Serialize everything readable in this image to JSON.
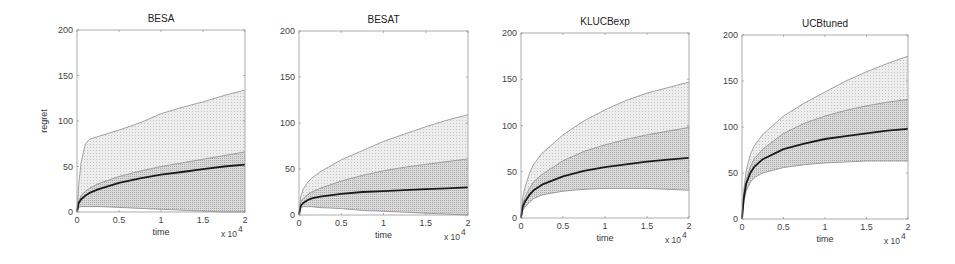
{
  "figure": {
    "ylabel": "regret",
    "xlabel": "time",
    "x_multiplier": "x 10",
    "x_multiplier_exp": "4",
    "colors": {
      "axis": "#9a9a9a",
      "mean_line": "#1a1a1a",
      "outer_band_fill": "#e6e6e6",
      "inner_band_fill": "#cfcfcf",
      "band_edge": "#8c8c8c"
    }
  },
  "chart_data": [
    {
      "type": "line",
      "title": "BESA",
      "xlabel": "time",
      "ylabel": "regret",
      "x_scale_note": "x 10^4",
      "xlim": [
        0,
        2
      ],
      "ylim": [
        0,
        200
      ],
      "xticks": [
        "0",
        "0.5",
        "1",
        "1.5",
        "2"
      ],
      "yticks": [
        "0",
        "50",
        "100",
        "150",
        "200"
      ],
      "grid": false,
      "x": [
        0,
        0.02,
        0.05,
        0.1,
        0.15,
        0.25,
        0.5,
        0.75,
        1.0,
        1.25,
        1.5,
        1.75,
        2.0
      ],
      "series": [
        {
          "name": "mean",
          "values": [
            0,
            10,
            14,
            18,
            21,
            25,
            32,
            37,
            41,
            44,
            47,
            50,
            52
          ]
        },
        {
          "name": "upper_outer",
          "values": [
            0,
            30,
            55,
            75,
            80,
            83,
            90,
            98,
            108,
            115,
            121,
            128,
            134
          ]
        },
        {
          "name": "upper_inner",
          "values": [
            0,
            12,
            18,
            23,
            26,
            31,
            39,
            45,
            50,
            54,
            58,
            62,
            66
          ]
        },
        {
          "name": "lower_inner",
          "values": [
            0,
            5,
            6,
            6,
            6,
            6,
            5,
            4,
            3,
            2,
            1,
            0,
            0
          ]
        },
        {
          "name": "lower_outer",
          "values": [
            0,
            5,
            6,
            6,
            6,
            6,
            5,
            4,
            3,
            2,
            1,
            0,
            0
          ]
        }
      ]
    },
    {
      "type": "line",
      "title": "BESAT",
      "xlabel": "time",
      "ylabel": "",
      "x_scale_note": "x 10^4",
      "xlim": [
        0,
        2
      ],
      "ylim": [
        0,
        200
      ],
      "xticks": [
        "0",
        "0.5",
        "1",
        "1.5",
        "2"
      ],
      "yticks": [
        "0",
        "50",
        "100",
        "150",
        "200"
      ],
      "grid": false,
      "x": [
        0,
        0.02,
        0.05,
        0.1,
        0.15,
        0.25,
        0.5,
        0.75,
        1.0,
        1.25,
        1.5,
        1.75,
        2.0
      ],
      "series": [
        {
          "name": "mean",
          "values": [
            0,
            10,
            13,
            16,
            18,
            20,
            23,
            25,
            26,
            27,
            28,
            29,
            30
          ]
        },
        {
          "name": "upper_outer",
          "values": [
            0,
            20,
            28,
            35,
            40,
            47,
            60,
            70,
            80,
            88,
            96,
            103,
            109
          ]
        },
        {
          "name": "upper_inner",
          "values": [
            0,
            14,
            18,
            22,
            25,
            29,
            37,
            43,
            48,
            52,
            55,
            58,
            61
          ]
        },
        {
          "name": "lower_inner",
          "values": [
            0,
            8,
            9,
            9,
            9,
            8,
            7,
            5,
            4,
            3,
            2,
            1,
            0
          ]
        },
        {
          "name": "lower_outer",
          "values": [
            0,
            8,
            9,
            9,
            9,
            8,
            7,
            5,
            4,
            3,
            2,
            1,
            0
          ]
        }
      ]
    },
    {
      "type": "line",
      "title": "KLUCBexp",
      "xlabel": "time",
      "ylabel": "",
      "x_scale_note": "x 10^4",
      "xlim": [
        0,
        2
      ],
      "ylim": [
        0,
        200
      ],
      "xticks": [
        "0",
        "0.5",
        "1",
        "1.5",
        "2"
      ],
      "yticks": [
        "0",
        "50",
        "100",
        "150",
        "200"
      ],
      "grid": false,
      "x": [
        0,
        0.02,
        0.05,
        0.1,
        0.15,
        0.25,
        0.5,
        0.75,
        1.0,
        1.25,
        1.5,
        1.75,
        2.0
      ],
      "series": [
        {
          "name": "mean",
          "values": [
            0,
            12,
            18,
            25,
            30,
            36,
            45,
            51,
            55,
            58,
            61,
            63,
            65
          ]
        },
        {
          "name": "upper_outer",
          "values": [
            0,
            22,
            34,
            48,
            58,
            70,
            90,
            105,
            117,
            127,
            135,
            141,
            147
          ]
        },
        {
          "name": "upper_inner",
          "values": [
            0,
            15,
            23,
            32,
            39,
            47,
            62,
            72,
            79,
            85,
            90,
            94,
            98
          ]
        },
        {
          "name": "lower_inner",
          "values": [
            0,
            8,
            12,
            17,
            21,
            25,
            29,
            31,
            32,
            32,
            32,
            31,
            30
          ]
        },
        {
          "name": "lower_outer",
          "values": [
            0,
            8,
            12,
            17,
            21,
            25,
            29,
            31,
            32,
            32,
            32,
            31,
            30
          ]
        }
      ]
    },
    {
      "type": "line",
      "title": "UCBtuned",
      "xlabel": "time",
      "ylabel": "",
      "x_scale_note": "x 10^4",
      "xlim": [
        0,
        2
      ],
      "ylim": [
        0,
        200
      ],
      "xticks": [
        "0",
        "0.5",
        "1",
        "1.5",
        "2"
      ],
      "yticks": [
        "0",
        "50",
        "100",
        "150",
        "200"
      ],
      "grid": false,
      "x": [
        0,
        0.02,
        0.05,
        0.1,
        0.15,
        0.25,
        0.5,
        0.75,
        1.0,
        1.25,
        1.5,
        1.75,
        2.0
      ],
      "series": [
        {
          "name": "mean",
          "values": [
            0,
            22,
            38,
            50,
            57,
            65,
            76,
            82,
            87,
            90,
            93,
            96,
            98
          ]
        },
        {
          "name": "upper_outer",
          "values": [
            0,
            30,
            52,
            70,
            80,
            92,
            112,
            126,
            138,
            150,
            160,
            169,
            177
          ]
        },
        {
          "name": "upper_inner",
          "values": [
            0,
            25,
            42,
            57,
            66,
            76,
            93,
            104,
            112,
            118,
            123,
            127,
            130
          ]
        },
        {
          "name": "lower_inner",
          "values": [
            0,
            18,
            30,
            40,
            45,
            50,
            56,
            59,
            61,
            62,
            63,
            63,
            63
          ]
        },
        {
          "name": "lower_outer",
          "values": [
            0,
            18,
            30,
            40,
            45,
            50,
            56,
            59,
            61,
            62,
            63,
            63,
            63
          ]
        }
      ]
    }
  ],
  "layout": {
    "panels": [
      {
        "left": 77,
        "right": 245,
        "top": 30,
        "bottom": 212
      },
      {
        "left": 299,
        "right": 468,
        "top": 31,
        "bottom": 215
      },
      {
        "left": 521,
        "right": 689,
        "top": 33,
        "bottom": 218
      },
      {
        "left": 742,
        "right": 908,
        "top": 35,
        "bottom": 219
      }
    ]
  }
}
